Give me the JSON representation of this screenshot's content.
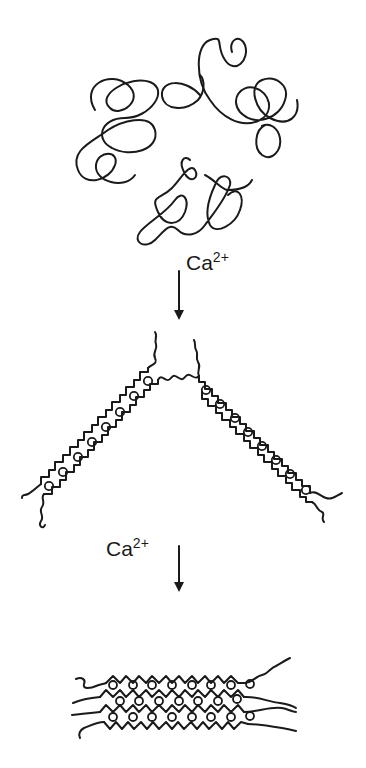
{
  "diagram": {
    "type": "process-flow",
    "colors": {
      "background": "#ffffff",
      "stroke": "#1a1a1a"
    },
    "stages": [
      {
        "id": "random-coils",
        "description": "tangled random-coil polymer chains"
      },
      {
        "id": "paired-chains",
        "description": "two chain segments with ions bound in zig-zag cavities (dimer junction)"
      },
      {
        "id": "aggregated-junctions",
        "description": "stacked multi-chain egg-box aggregate with bound ions"
      }
    ],
    "arrows": [
      {
        "from": "random-coils",
        "to": "paired-chains",
        "label_ion": "Ca",
        "label_charge": "2+"
      },
      {
        "from": "paired-chains",
        "to": "aggregated-junctions",
        "label_ion": "Ca",
        "label_charge": "2+"
      }
    ]
  }
}
